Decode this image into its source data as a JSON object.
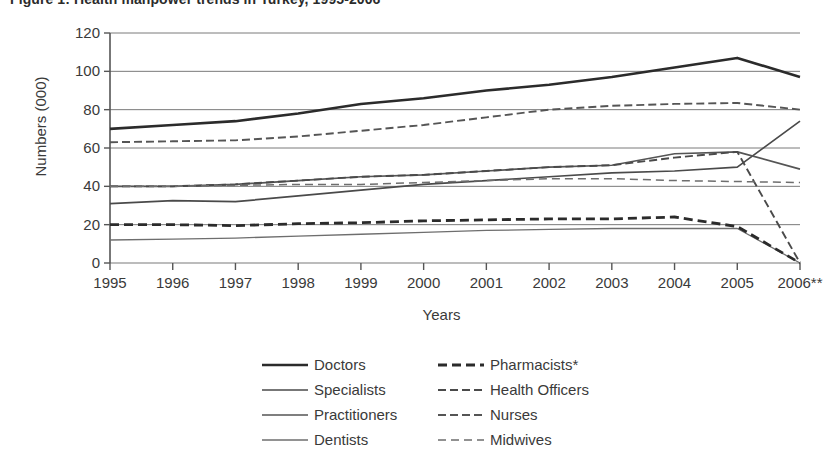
{
  "figure": {
    "title": "Figure 1: Health manpower trends in Turkey, 1995-2006"
  },
  "axes": {
    "y_title": "Numbers (000)",
    "x_title": "Years",
    "y_ticks": [
      "0",
      "20",
      "40",
      "60",
      "80",
      "100",
      "120"
    ],
    "x_ticks": [
      "1995",
      "1996",
      "1997",
      "1998",
      "1999",
      "2000",
      "2001",
      "2002",
      "2003",
      "2004",
      "2005",
      "2006**"
    ]
  },
  "legend": {
    "left_column": [
      {
        "label": "Doctors",
        "style": "solid-thick",
        "color": "#2b2b2b"
      },
      {
        "label": "Specialists",
        "style": "solid-medium",
        "color": "#4a4a4a"
      },
      {
        "label": "Practitioners",
        "style": "solid-medium",
        "color": "#555555"
      },
      {
        "label": "Dentists",
        "style": "solid-thin",
        "color": "#6e6e6e"
      }
    ],
    "right_column": [
      {
        "label": "Pharmacists*",
        "style": "dashed-thick",
        "color": "#2b2b2b"
      },
      {
        "label": "Health Officers",
        "style": "dashed-medium",
        "color": "#4a4a4a"
      },
      {
        "label": "Nurses",
        "style": "dashed-medium",
        "color": "#555555"
      },
      {
        "label": "Midwives",
        "style": "dashed-thin",
        "color": "#6e6e6e"
      }
    ]
  },
  "chart_data": {
    "type": "line",
    "title": "Figure 1: Health manpower trends in Turkey, 1995-2006",
    "xlabel": "Years",
    "ylabel": "Numbers (000)",
    "categories": [
      "1995",
      "1996",
      "1997",
      "1998",
      "1999",
      "2000",
      "2001",
      "2002",
      "2003",
      "2004",
      "2005",
      "2006**"
    ],
    "xlim": [
      0,
      11
    ],
    "ylim": [
      0,
      120
    ],
    "yticks": [
      0,
      20,
      40,
      60,
      80,
      100,
      120
    ],
    "grid": "horizontal",
    "legend_position": "bottom",
    "footnotes": [
      "* Pharmacists",
      "** 2006"
    ],
    "series": [
      {
        "name": "Doctors",
        "style": "solid-thick",
        "color": "#2b2b2b",
        "values": [
          70,
          72,
          74,
          78,
          83,
          86,
          90,
          93,
          97,
          102,
          107,
          97
        ]
      },
      {
        "name": "Specialists",
        "style": "solid-medium",
        "color": "#4a4a4a",
        "values": [
          31,
          32.5,
          32,
          35,
          38,
          41,
          43,
          45,
          47,
          48,
          50,
          74
        ]
      },
      {
        "name": "Practitioners",
        "style": "solid-medium",
        "color": "#555555",
        "values": [
          40,
          40,
          41,
          43,
          45,
          46,
          48,
          50,
          51,
          57,
          58,
          49
        ]
      },
      {
        "name": "Dentists",
        "style": "solid-thin",
        "color": "#6e6e6e",
        "values": [
          12,
          12.5,
          13,
          14,
          15,
          16,
          17,
          17.5,
          18,
          18,
          18,
          0
        ]
      },
      {
        "name": "Pharmacists*",
        "style": "dashed-thick",
        "color": "#2b2b2b",
        "values": [
          20,
          20,
          19.5,
          20.5,
          21,
          22,
          22.5,
          23,
          23,
          24,
          19,
          0
        ]
      },
      {
        "name": "Health Officers",
        "style": "dashed-medium",
        "color": "#4a4a4a",
        "values": [
          40,
          40,
          41,
          43,
          45,
          46,
          48,
          50,
          51,
          55,
          58,
          0
        ]
      },
      {
        "name": "Nurses",
        "style": "dashed-medium",
        "color": "#555555",
        "values": [
          63,
          63.5,
          64,
          66,
          69,
          72,
          76,
          80,
          82,
          83,
          83.5,
          80
        ]
      },
      {
        "name": "Midwives",
        "style": "dashed-thin",
        "color": "#6e6e6e",
        "values": [
          40,
          40,
          40.5,
          41,
          41,
          42,
          43,
          44,
          44,
          43,
          42.5,
          42
        ]
      }
    ]
  }
}
